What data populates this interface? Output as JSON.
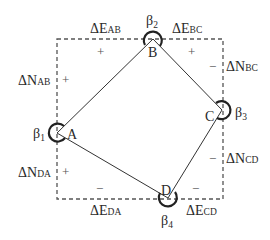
{
  "diagram": {
    "type": "traverse-closed-polygon",
    "colors": {
      "line": "#333333",
      "dashed": "#555555",
      "text": "#2a2a2a",
      "background": "#ffffff"
    },
    "bounding_box": {
      "left": 57,
      "top": 39,
      "right": 223,
      "bottom": 199,
      "style": "dashed"
    },
    "vertices": [
      {
        "id": "A",
        "label": "A",
        "x": 57,
        "y": 133,
        "angle_label": "β",
        "angle_sub": "1"
      },
      {
        "id": "B",
        "label": "B",
        "x": 153,
        "y": 39,
        "angle_label": "β",
        "angle_sub": "2"
      },
      {
        "id": "C",
        "label": "C",
        "x": 222,
        "y": 110,
        "angle_label": "β",
        "angle_sub": "3"
      },
      {
        "id": "D",
        "label": "D",
        "x": 168,
        "y": 198,
        "angle_label": "β",
        "angle_sub": "4"
      }
    ],
    "edges": [
      {
        "from": "A",
        "to": "B"
      },
      {
        "from": "B",
        "to": "C"
      },
      {
        "from": "C",
        "to": "D"
      },
      {
        "from": "D",
        "to": "A"
      }
    ],
    "labels": {
      "dE_AB": {
        "main": "ΔE",
        "sub": "AB"
      },
      "dE_BC": {
        "main": "ΔE",
        "sub": "BC"
      },
      "dN_AB": {
        "main": "ΔN",
        "sub": "AB"
      },
      "dN_BC": {
        "main": "ΔN",
        "sub": "BC"
      },
      "dN_CD": {
        "main": "ΔN",
        "sub": "CD"
      },
      "dN_DA": {
        "main": "ΔN",
        "sub": "DA"
      },
      "dE_DA": {
        "main": "ΔE",
        "sub": "DA"
      },
      "dE_CD": {
        "main": "ΔE",
        "sub": "CD"
      }
    },
    "signs": {
      "dE_AB": "+",
      "dN_AB": "+",
      "dE_BC": "+",
      "dN_BC": "−",
      "dN_CD": "−",
      "dE_CD": "−",
      "dE_DA": "−",
      "dN_DA": "+"
    }
  }
}
